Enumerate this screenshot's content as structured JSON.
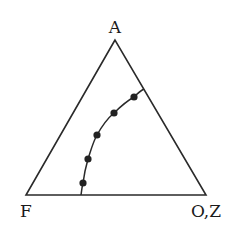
{
  "diagram": {
    "type": "ternary",
    "vertices": {
      "top": {
        "label": "A",
        "x": 115,
        "y": 40
      },
      "left": {
        "label": "F",
        "x": 26,
        "y": 195
      },
      "right": {
        "label": "O,Z",
        "x": 206,
        "y": 195
      }
    },
    "labels": {
      "top": "A",
      "left": "F",
      "right": "O,Z"
    },
    "curve": {
      "start": {
        "x": 81,
        "y": 195
      },
      "end": {
        "x": 144,
        "y": 89
      },
      "points": [
        {
          "x": 83,
          "y": 183
        },
        {
          "x": 88,
          "y": 159
        },
        {
          "x": 97,
          "y": 135
        },
        {
          "x": 114,
          "y": 113
        },
        {
          "x": 134,
          "y": 97
        }
      ]
    },
    "colors": {
      "line": "#2a2a2a",
      "dot": "#222222",
      "background": "#ffffff"
    }
  }
}
